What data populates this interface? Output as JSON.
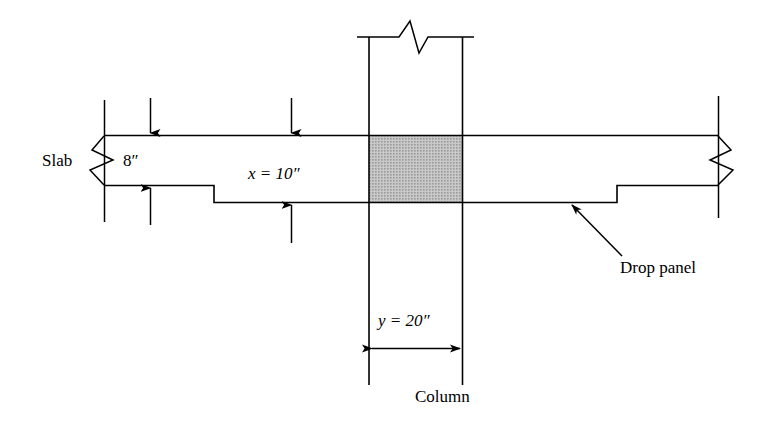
{
  "figure": {
    "type": "engineering-section-diagram",
    "background_color": "#ffffff",
    "line_color": "#000000",
    "shade_color": "#b0b0b0"
  },
  "labels": {
    "slab": "Slab",
    "slab_thickness": "8″",
    "drop_panel_depth": "x = 10″",
    "column_width": "y = 20″",
    "column": "Column",
    "drop_panel": "Drop panel"
  },
  "dimensions": [
    {
      "name": "slab-thickness",
      "symbol": "",
      "value": "8",
      "unit": "in",
      "text": "8″",
      "orientation": "vertical"
    },
    {
      "name": "drop-panel-total-depth",
      "symbol": "x",
      "value": "10",
      "unit": "in",
      "text": "x = 10″",
      "orientation": "vertical"
    },
    {
      "name": "column-width",
      "symbol": "y",
      "value": "20",
      "unit": "in",
      "text": "y = 20″",
      "orientation": "horizontal"
    }
  ],
  "parts": [
    {
      "name": "slab",
      "label": "Slab"
    },
    {
      "name": "drop-panel",
      "label": "Drop panel"
    },
    {
      "name": "column",
      "label": "Column"
    },
    {
      "name": "shaded-joint-region",
      "label": ""
    }
  ]
}
